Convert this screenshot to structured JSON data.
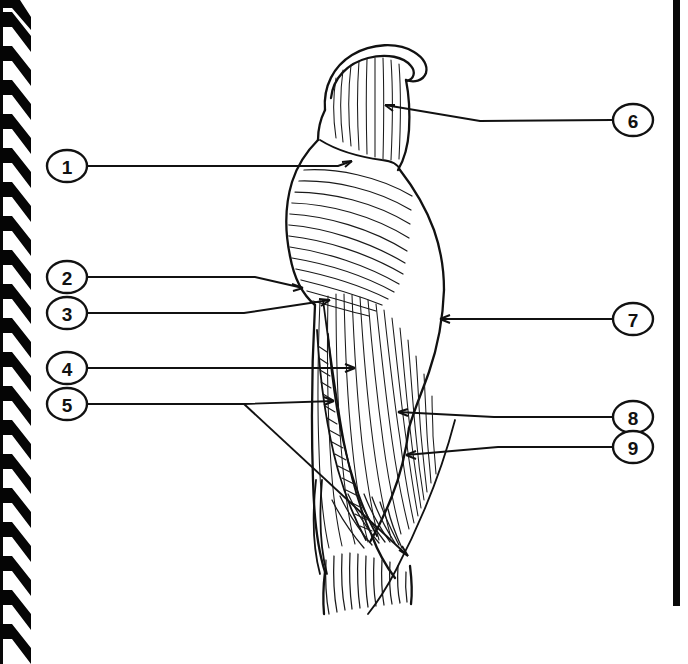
{
  "page": {
    "type": "worksheet-page",
    "background_color": "#ffffff",
    "ink_color": "#111111",
    "width": 688,
    "height": 664
  },
  "binding": {
    "name": "spiral-binding",
    "side": "left",
    "tooth_color": "#050505",
    "tooth_count": 18
  },
  "border": {
    "name": "right-page-edge",
    "color": "#080808"
  },
  "figure": {
    "name": "lateral-leg-musculature",
    "view": "lateral"
  },
  "callouts": {
    "left": [
      {
        "number": "1",
        "cx": 67,
        "cy": 166
      },
      {
        "number": "2",
        "cx": 67,
        "cy": 277
      },
      {
        "number": "3",
        "cx": 67,
        "cy": 313
      },
      {
        "number": "4",
        "cx": 67,
        "cy": 368
      },
      {
        "number": "5",
        "cx": 67,
        "cy": 404
      }
    ],
    "right": [
      {
        "number": "6",
        "cx": 633,
        "cy": 120
      },
      {
        "number": "7",
        "cx": 633,
        "cy": 319
      },
      {
        "number": "8",
        "cx": 633,
        "cy": 417
      },
      {
        "number": "9",
        "cx": 633,
        "cy": 447
      }
    ]
  }
}
